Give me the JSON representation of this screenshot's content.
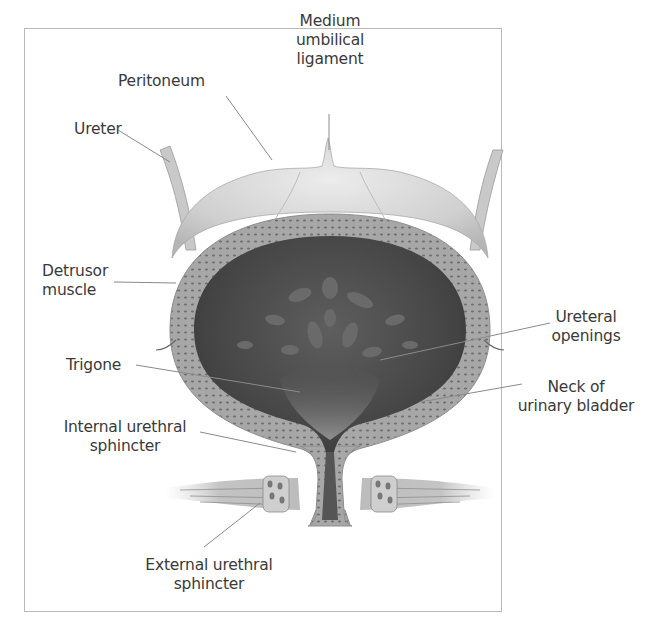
{
  "diagram": {
    "labels": {
      "medium_umbilical_ligament": "Medium\numbilical\nligament",
      "peritoneum": "Peritoneum",
      "ureter": "Ureter",
      "detrusor_muscle": "Detrusor\nmuscle",
      "ureteral_openings": "Ureteral\nopenings",
      "trigone": "Trigone",
      "neck_of_urinary_bladder": "Neck of\nurinary bladder",
      "internal_urethral_sphincter": "Internal urethral\nsphincter",
      "external_urethral_sphincter": "External urethral\nsphincter"
    },
    "colors": {
      "label_text": "#3a3a3a",
      "leader_line": "#8a8a8a",
      "frame_border": "#b9b9b9",
      "wall": "#a9a9a9",
      "lumen": "#4a4a4a",
      "peritoneum": "#d4d4d4"
    }
  }
}
